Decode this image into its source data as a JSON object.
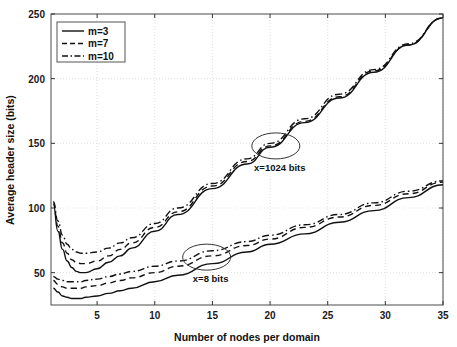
{
  "chart_data": {
    "type": "line",
    "title": "",
    "xlabel": "Number of nodes per domain",
    "ylabel": "Average header size (bits)",
    "xlim": [
      1,
      35
    ],
    "ylim": [
      25,
      250
    ],
    "xticks": [
      5,
      10,
      15,
      20,
      25,
      30,
      35
    ],
    "yticks": [
      50,
      100,
      150,
      200,
      250
    ],
    "xticklabels": [
      "5",
      "10",
      "15",
      "20",
      "25",
      "30",
      "35"
    ],
    "yticklabels": [
      "50",
      "100",
      "150",
      "200",
      "250"
    ],
    "grid": true,
    "grid_style": "dotted",
    "legend_position": "upper left",
    "legend_entries": [
      {
        "label": "m=3",
        "style": "solid"
      },
      {
        "label": "m=7",
        "style": "dashed"
      },
      {
        "label": "m=10",
        "style": "dashdot"
      }
    ],
    "annotations": [
      {
        "text": "x=1024 bits",
        "marker": "ellipse",
        "x": 20.5,
        "y": 148
      },
      {
        "text": "x=8 bits",
        "marker": "ellipse",
        "x": 14.5,
        "y": 62
      }
    ],
    "groups": [
      {
        "name": "x=1024 bits",
        "series": [
          {
            "name": "m=3",
            "style": "solid",
            "x": [
              1.2,
              1.6,
              2.0,
              2.4,
              2.8,
              3.2,
              3.6,
              4.0,
              5.0,
              6.0,
              7.0,
              8.0,
              10.0,
              12.0,
              15.0,
              18.0,
              20.0,
              23.0,
              26.0,
              29.0,
              32.0,
              35.0
            ],
            "y": [
              103,
              82,
              68,
              59,
              54,
              51,
              50,
              50,
              53,
              58,
              63,
              69,
              82,
              95,
              115,
              134,
              147,
              166,
              185,
              205,
              226,
              247
            ]
          },
          {
            "name": "m=7",
            "style": "dashed",
            "x": [
              1.2,
              1.6,
              2.0,
              2.4,
              2.8,
              3.2,
              3.6,
              4.0,
              5.0,
              6.0,
              7.0,
              8.0,
              10.0,
              12.0,
              15.0,
              18.0,
              20.0,
              23.0,
              26.0,
              29.0,
              32.0,
              35.0
            ],
            "y": [
              104,
              86,
              73,
              65,
              60,
              58,
              57,
              57,
              59,
              63,
              68,
              73,
              85,
              97,
              117,
              136,
              148,
              167,
              186,
              206,
              226,
              247
            ]
          },
          {
            "name": "m=10",
            "style": "dashdot",
            "x": [
              1.2,
              1.6,
              2.0,
              2.4,
              2.8,
              3.2,
              3.6,
              4.0,
              5.0,
              6.0,
              7.0,
              8.0,
              10.0,
              12.0,
              15.0,
              18.0,
              20.0,
              23.0,
              26.0,
              29.0,
              32.0,
              35.0
            ],
            "y": [
              105,
              90,
              79,
              72,
              68,
              66,
              65,
              65,
              66,
              69,
              73,
              77,
              88,
              100,
              119,
              138,
              150,
              169,
              188,
              207,
              227,
              247
            ]
          }
        ]
      },
      {
        "name": "x=8 bits",
        "series": [
          {
            "name": "m=3",
            "style": "solid",
            "x": [
              1.2,
              1.6,
              2.0,
              2.4,
              2.8,
              3.2,
              3.6,
              4.0,
              5.0,
              6.0,
              7.0,
              8.0,
              10.0,
              12.0,
              15.0,
              18.0,
              20.0,
              23.0,
              26.0,
              29.0,
              32.0,
              35.0
            ],
            "y": [
              38,
              35,
              32,
              31,
              30,
              30,
              30,
              31,
              32,
              34,
              36,
              38,
              43,
              48,
              57,
              66,
              72,
              80,
              89,
              98,
              108,
              118
            ]
          },
          {
            "name": "m=7",
            "style": "dashed",
            "x": [
              1.2,
              1.6,
              2.0,
              2.4,
              2.8,
              3.2,
              3.6,
              4.0,
              5.0,
              6.0,
              7.0,
              8.0,
              10.0,
              12.0,
              15.0,
              18.0,
              20.0,
              23.0,
              26.0,
              29.0,
              32.0,
              35.0
            ],
            "y": [
              44,
              41,
              39,
              38,
              38,
              38,
              38,
              39,
              40,
              42,
              44,
              46,
              50,
              55,
              63,
              71,
              76,
              85,
              93,
              102,
              111,
              120
            ]
          },
          {
            "name": "m=10",
            "style": "dashdot",
            "x": [
              1.2,
              1.6,
              2.0,
              2.4,
              2.8,
              3.2,
              3.6,
              4.0,
              5.0,
              6.0,
              7.0,
              8.0,
              10.0,
              12.0,
              15.0,
              18.0,
              20.0,
              23.0,
              26.0,
              29.0,
              32.0,
              35.0
            ],
            "y": [
              47,
              45,
              44,
              43,
              43,
              43,
              43,
              44,
              45,
              47,
              49,
              51,
              55,
              59,
              67,
              74,
              79,
              87,
              95,
              104,
              113,
              121
            ]
          }
        ]
      }
    ]
  }
}
